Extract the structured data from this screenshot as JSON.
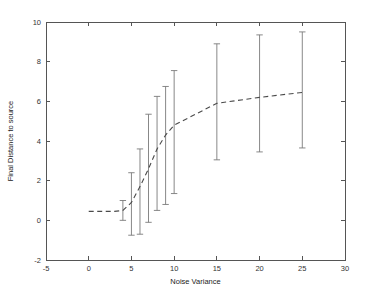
{
  "chart_data": {
    "type": "line",
    "title": "",
    "xlabel": "Noise Variance",
    "ylabel": "Final Distance to source",
    "xlim": [
      -5,
      30
    ],
    "ylim": [
      -2,
      10
    ],
    "xticks": [
      -5,
      0,
      5,
      10,
      15,
      20,
      25,
      30
    ],
    "xticklabels": [
      "-5",
      "0",
      "5",
      "10",
      "15",
      "20",
      "25",
      "30"
    ],
    "yticks": [
      -2,
      0,
      2,
      4,
      6,
      8,
      10
    ],
    "yticklabels": [
      "-2",
      "0",
      "2",
      "4",
      "6",
      "8",
      "10"
    ],
    "grid": false,
    "legend": null,
    "series": [
      {
        "name": "mean final distance",
        "style": "dashed",
        "color": "#4a4a4a",
        "x": [
          0,
          1,
          2,
          3,
          4,
          5,
          6,
          7,
          8,
          9,
          10,
          15,
          20,
          25
        ],
        "values": [
          0.45,
          0.45,
          0.45,
          0.45,
          0.5,
          0.9,
          1.7,
          2.6,
          3.6,
          4.3,
          4.8,
          5.9,
          6.2,
          6.45
        ]
      }
    ],
    "errorbars": {
      "description": "vertical error bars with horizontal caps at both ends, no plotted mean marker",
      "x": [
        4,
        5,
        6,
        7,
        8,
        9,
        10,
        15,
        20,
        25
      ],
      "lower": [
        0.0,
        -0.75,
        -0.7,
        -0.1,
        0.5,
        0.8,
        1.35,
        3.05,
        3.45,
        3.65
      ],
      "upper": [
        1.0,
        2.4,
        3.6,
        5.35,
        6.25,
        6.75,
        7.55,
        8.9,
        9.35,
        9.5
      ]
    },
    "axis_color": "#555555",
    "errorbar_color": "#7a7a7a",
    "background": "#ffffff"
  },
  "geometry": {
    "plot_left_px": 46,
    "plot_right_px": 345,
    "plot_top_px": 22,
    "plot_bottom_px": 260
  }
}
